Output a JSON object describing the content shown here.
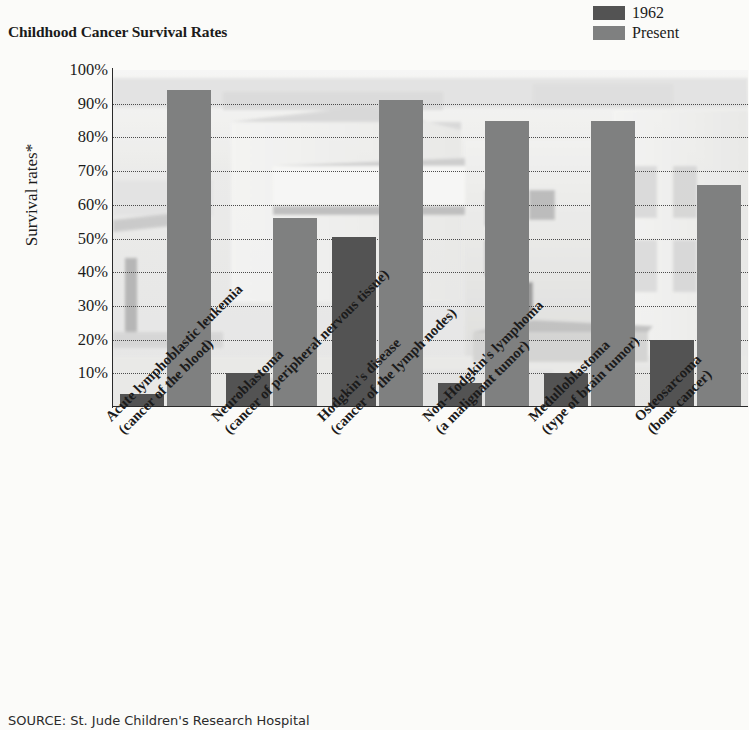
{
  "title": "Childhood Cancer Survival Rates",
  "source_note": "SOURCE: St. Jude Children's Research Hospital",
  "y_axis_title": "Survival rates*",
  "legend": {
    "position": "top-right",
    "entries": [
      {
        "label": "1962",
        "color": "#535353"
      },
      {
        "label": "Present",
        "color": "#7f8080"
      }
    ]
  },
  "colors": {
    "bar_1962": "#535353",
    "bar_present": "#7f8080",
    "gridline": "#4b4b4b",
    "axis": "#2a2a2a",
    "page_background": "#fbfbf9"
  },
  "chart_data": {
    "type": "bar",
    "title": "Childhood Cancer Survival Rates",
    "xlabel": "",
    "ylabel": "Survival rates*",
    "ylim": [
      0,
      100
    ],
    "ytick_labels": [
      "100%",
      "90%",
      "80%",
      "70%",
      "60%",
      "50%",
      "40%",
      "30%",
      "20%",
      "10%"
    ],
    "ytick_values": [
      100,
      90,
      80,
      70,
      60,
      50,
      40,
      30,
      20,
      10
    ],
    "grid": true,
    "grid_style": "dotted-horizontal",
    "legend_position": "top-right",
    "background_image": "faded black-and-white photograph of hospital buildings",
    "categories": [
      "Acute lymphoblastic leukemia",
      "Neuroblastoma",
      "Hodgkin's disease",
      "Non-Hodgkin's lymphoma",
      "Medulloblastoma",
      "Osteosarcoma"
    ],
    "category_sublabels": [
      "(cancer of the blood)",
      "(cancer of peripheral nervous tissue)",
      "(cancer of the lymph nodes)",
      "(a malignant tumor)",
      "(type of brain tumor)",
      "(bone cancer)"
    ],
    "series": [
      {
        "name": "1962",
        "values": [
          4,
          10,
          50.5,
          7,
          10,
          20
        ]
      },
      {
        "name": "Present",
        "values": [
          94,
          56,
          91,
          85,
          85,
          66
        ]
      }
    ]
  }
}
